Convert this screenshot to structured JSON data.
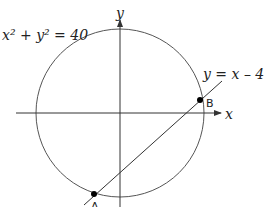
{
  "diagram": {
    "circle_equation": "x² + y² = 40",
    "line_equation": "y = x – 4",
    "x_axis_label": "x",
    "y_axis_label": "y",
    "points": [
      {
        "name": "A",
        "label": "A"
      },
      {
        "name": "B",
        "label": "B"
      }
    ],
    "colors": {
      "stroke": "#333333",
      "point": "#000000",
      "background": "#ffffff"
    }
  }
}
